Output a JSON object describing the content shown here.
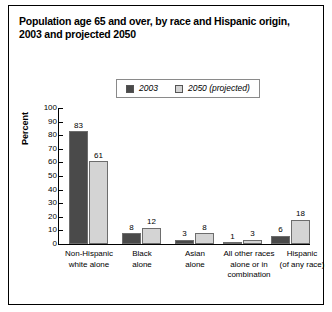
{
  "title": {
    "line1": "Population age 65 and over, by race and Hispanic origin,",
    "line2": "2003 and projected 2050"
  },
  "colors": {
    "series_2003": "#4a4a4a",
    "series_2050": "#d4d4d4",
    "bar_border": "#6d6d6d",
    "axis": "#000000",
    "frame": "#000000",
    "legend_border": "#8a8a8a"
  },
  "legend": {
    "position": "top-center",
    "items": [
      {
        "label": "2003",
        "swatch": "#4a4a4a"
      },
      {
        "label": "2050 (projected)",
        "swatch": "#d4d4d4"
      }
    ]
  },
  "chart_data": {
    "type": "bar",
    "title": "Population age 65 and over, by race and Hispanic origin, 2003 and projected 2050",
    "xlabel": "",
    "ylabel": "Percent",
    "ylim": [
      0,
      100
    ],
    "ytick_step": 10,
    "yticks": [
      0,
      10,
      20,
      30,
      40,
      50,
      60,
      70,
      80,
      90,
      100
    ],
    "ytick_labels": [
      "0",
      "10",
      "20",
      "30",
      "40",
      "50",
      "60",
      "70",
      "80",
      "90",
      "100"
    ],
    "grid": false,
    "legend_position": "top-center",
    "categories": [
      "Non-Hispanic white alone",
      "Black alone",
      "Asian alone",
      "All other races alone or in combination",
      "Hispanic (of any race)"
    ],
    "category_label_lines": [
      [
        "Non-Hispanic",
        "white alone"
      ],
      [
        "Black",
        "alone"
      ],
      [
        "Asian",
        "alone"
      ],
      [
        "All other races",
        "alone or in",
        "combination"
      ],
      [
        "Hispanic",
        "(of any race)"
      ]
    ],
    "series": [
      {
        "name": "2003",
        "color": "#4a4a4a",
        "values": [
          83,
          8,
          3,
          1,
          6
        ]
      },
      {
        "name": "2050 (projected)",
        "color": "#d4d4d4",
        "values": [
          61,
          12,
          8,
          3,
          18
        ]
      }
    ],
    "value_labels": [
      [
        "83",
        "61"
      ],
      [
        "8",
        "12"
      ],
      [
        "3",
        "8"
      ],
      [
        "1",
        "3"
      ],
      [
        "6",
        "18"
      ]
    ]
  }
}
